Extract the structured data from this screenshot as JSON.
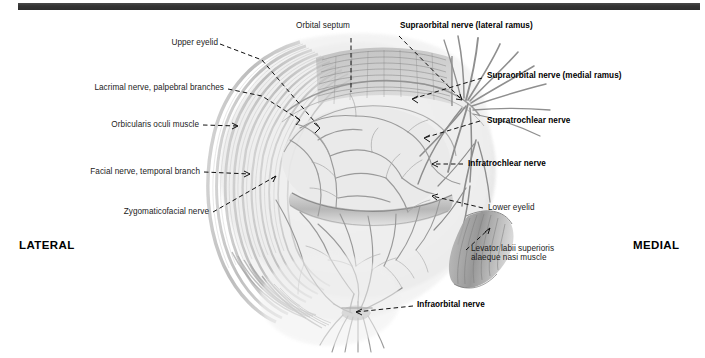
{
  "figure": {
    "width": 705,
    "height": 358,
    "background": "#ffffff",
    "rule_color": "#343434"
  },
  "orientation": {
    "lateral": "LATERAL",
    "medial": "MEDIAL"
  },
  "labels": {
    "upper_eyelid": "Upper eyelid",
    "orbital_septum": "Orbital septum",
    "supraorbital_lateral": "Supraorbital nerve (lateral ramus)",
    "supraorbital_medial": "Supraorbital nerve (medial ramus)",
    "supratrochlear": "Supratrochlear nerve",
    "infratrochlear": "Infratrochlear nerve",
    "lacrimal": "Lacrimal nerve, palpebral branches",
    "orbicularis": "Orbicularis oculi muscle",
    "facial_temporal": "Facial nerve, temporal branch",
    "zygomaticofacial": "Zygomaticofacial nerve",
    "lower_eyelid": "Lower eyelid",
    "levator_line1": "Levator labii superioris",
    "levator_line2": "alaeque nasi muscle",
    "infraorbital": "Infraorbital nerve"
  },
  "colors": {
    "text": "#1b1b1b",
    "bold_text": "#000000",
    "leader": "#111111",
    "ink_dark": "#6f6f6f",
    "ink_mid": "#9a9a9a",
    "ink_light": "#c9c9c9",
    "tissue": "#e9e9e9"
  }
}
